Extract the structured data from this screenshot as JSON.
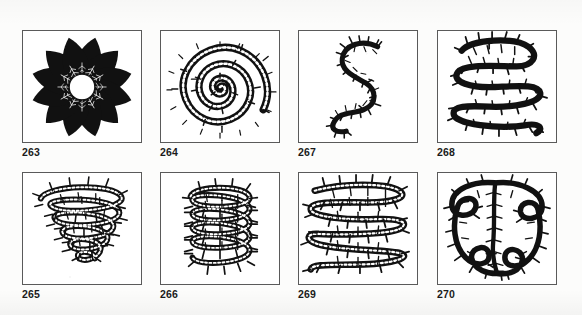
{
  "plate": {
    "background_color": "#fcfcfb",
    "ink_color": "#111111",
    "frame_color": "#5a5a5a",
    "panel_count": 8,
    "rows": 2,
    "columns": 4
  },
  "figures": [
    {
      "number": "263",
      "caption": "263",
      "row": 1,
      "column": 1,
      "x": 22,
      "y": 30,
      "width": 120,
      "height": 113,
      "caption_x": 22,
      "caption_y": 148,
      "motif": "radial-rosette",
      "description": "Radial rosette of twelve dark pointed leaf-shaped petals arranged around a blank white circular centre",
      "element_count": 12,
      "center_hole": true
    },
    {
      "number": "264",
      "caption": "264",
      "row": 1,
      "column": 2,
      "x": 160,
      "y": 30,
      "width": 120,
      "height": 113,
      "caption_x": 160,
      "caption_y": 148,
      "motif": "concentric-spiral",
      "description": "Tight circular spiral of five turns drawn as a thick barbed band with spiky serrated edges",
      "turns": 5,
      "center_hole": false
    },
    {
      "number": "267",
      "caption": "267",
      "row": 1,
      "column": 3,
      "x": 298,
      "y": 30,
      "width": 120,
      "height": 113,
      "caption_x": 298,
      "caption_y": 148,
      "motif": "s-meander",
      "description": "Open S-shaped serpentine meander, a single thin barbed line with two reversing curves",
      "turns": 2,
      "center_hole": false
    },
    {
      "number": "268",
      "caption": "268",
      "row": 1,
      "column": 4,
      "x": 437,
      "y": 30,
      "width": 120,
      "height": 113,
      "caption_x": 437,
      "caption_y": 148,
      "motif": "boustrophedon-meander",
      "description": "Dense boustrophedon meander of four back-and-forth sweeps filling the square with barbed bands",
      "turns": 4,
      "center_hole": false
    },
    {
      "number": "265",
      "caption": "265",
      "row": 2,
      "column": 1,
      "x": 22,
      "y": 172,
      "width": 120,
      "height": 113,
      "caption_x": 22,
      "caption_y": 290,
      "motif": "conical-vortex",
      "description": "Cone-shaped vortex coil, wide at the top and narrowing to the base, drawn with feathery barbed bands",
      "turns": 6,
      "center_hole": false
    },
    {
      "number": "266",
      "caption": "266",
      "row": 2,
      "column": 2,
      "x": 160,
      "y": 172,
      "width": 120,
      "height": 113,
      "caption_x": 160,
      "caption_y": 290,
      "motif": "cylindrical-coil",
      "description": "Vertical cylindrical coil or spring of five stacked loops with spiky barbed outlines",
      "turns": 5,
      "center_hole": false
    },
    {
      "number": "269",
      "caption": "269",
      "row": 2,
      "column": 3,
      "x": 298,
      "y": 172,
      "width": 120,
      "height": 113,
      "caption_x": 298,
      "caption_y": 290,
      "motif": "horizontal-zigzag-fill",
      "description": "Dense horizontal zigzag fill of five stacked serpentine rows of barbed bands",
      "turns": 5,
      "center_hole": false
    },
    {
      "number": "270",
      "caption": "270",
      "row": 2,
      "column": 4,
      "x": 437,
      "y": 172,
      "width": 120,
      "height": 113,
      "caption_x": 437,
      "caption_y": 290,
      "motif": "dense-scribble-fill",
      "description": "Dense irregular scribble fill of interlocking barbed loops covering the whole square",
      "turns": 7,
      "center_hole": false
    }
  ]
}
